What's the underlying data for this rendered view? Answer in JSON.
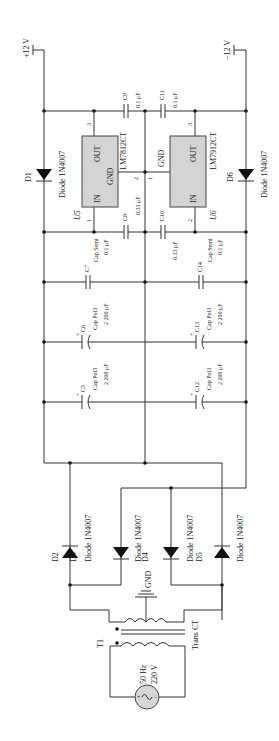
{
  "diagram": {
    "type": "circuit-schematic",
    "rails": {
      "positive": {
        "label": "+12 V"
      },
      "negative": {
        "label": "−12 V"
      }
    },
    "regulators": [
      {
        "ref": "U5",
        "part": "LM7812CT",
        "pins": {
          "in": "IN",
          "out": "OUT",
          "gnd": "GND"
        },
        "pin_numbers": {
          "in": "1",
          "gnd": "2",
          "out": "3"
        }
      },
      {
        "ref": "U6",
        "part": "LM7912CT",
        "pins": {
          "in": "IN",
          "out": "OUT",
          "gnd": "GND"
        },
        "pin_numbers": {
          "gnd": "1",
          "in": "2",
          "out": "3"
        }
      }
    ],
    "capacitors": [
      {
        "ref": "C9",
        "type": "",
        "value": "0.1 μF"
      },
      {
        "ref": "C11",
        "type": "",
        "value": "0.1 μF"
      },
      {
        "ref": "C8",
        "type": "",
        "value": "0.33 μF"
      },
      {
        "ref": "C10",
        "type": "",
        "value": "0.33 μF"
      },
      {
        "ref": "C7",
        "type": "Cap Semi",
        "value": "0.1 μF"
      },
      {
        "ref": "C14",
        "type": "Cap Semi",
        "value": "0.1 μF"
      },
      {
        "ref": "C6",
        "type": "Cap Pol3",
        "value": "2 200 μF",
        "polar": "+"
      },
      {
        "ref": "C13",
        "type": "Cap Pol3",
        "value": "2 200 μF",
        "polar": "+"
      },
      {
        "ref": "C5",
        "type": "Cap Pol3",
        "value": "2 200 μF",
        "polar": "+"
      },
      {
        "ref": "C12",
        "type": "Cap Pol3",
        "value": "2 200 μF",
        "polar": "+"
      }
    ],
    "diodes": [
      {
        "ref": "D1",
        "part": "Diode 1N4007"
      },
      {
        "ref": "D6",
        "part": "Diode 1N4007"
      },
      {
        "ref": "D2",
        "part": "Diode 1N4007"
      },
      {
        "ref": "D3",
        "part": "Diode 1N4007"
      },
      {
        "ref": "D4",
        "part": "Diode 1N4007"
      },
      {
        "ref": "D5",
        "part": "Diode 1N4007"
      }
    ],
    "ground": {
      "label": "GND"
    },
    "transformer": {
      "ref": "T1",
      "part": "Trans CT"
    },
    "source": {
      "frequency": "50 Hz",
      "voltage": "220 V",
      "plus": "+",
      "minus": "−"
    }
  }
}
